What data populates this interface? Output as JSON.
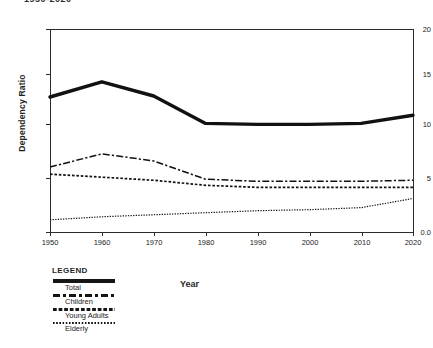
{
  "title_clipped": "1950-2020",
  "chart_data": {
    "type": "line",
    "title": "1950-2020",
    "xlabel": "Year",
    "ylabel": "Dependency Ratio",
    "x": [
      1950,
      1960,
      1970,
      1980,
      1990,
      2000,
      2010,
      2020
    ],
    "xticklabels": [
      "1950",
      "1960",
      "1970",
      "1980",
      "1990",
      "2000",
      "2010",
      "2020"
    ],
    "yticklabels": [
      "0.0",
      "5",
      "10",
      "15",
      "20"
    ],
    "ytickvalues": [
      0,
      5,
      10,
      15,
      20
    ],
    "xlim": [
      1950,
      2020
    ],
    "ylim": [
      0,
      20
    ],
    "grid": false,
    "legend_position": "below-left",
    "series": [
      {
        "name": "Total",
        "style": "solid-thick",
        "values": [
          13.3,
          14.8,
          13.4,
          10.7,
          10.6,
          10.6,
          10.7,
          11.5
        ]
      },
      {
        "name": "Children",
        "style": "dash-dot",
        "values": [
          6.4,
          7.7,
          7.0,
          5.2,
          5.0,
          5.0,
          5.0,
          5.1
        ]
      },
      {
        "name": "Young Adults",
        "style": "dashed",
        "values": [
          5.7,
          5.4,
          5.1,
          4.6,
          4.4,
          4.4,
          4.4,
          4.4
        ]
      },
      {
        "name": "Elderly",
        "style": "dotted",
        "values": [
          1.2,
          1.5,
          1.7,
          1.9,
          2.1,
          2.2,
          2.4,
          3.3
        ]
      }
    ]
  },
  "legend": {
    "title": "LEGEND",
    "entries": [
      {
        "label": "Total"
      },
      {
        "label": "Children"
      },
      {
        "label": "Young Adults"
      },
      {
        "label": "Elderly"
      }
    ]
  },
  "axes": {
    "y": {
      "label": "Dependency Ratio",
      "ticks": [
        {
          "label": "20"
        },
        {
          "label": "15"
        },
        {
          "label": "10"
        },
        {
          "label": "5"
        },
        {
          "label": "0.0"
        }
      ]
    },
    "x": {
      "label": "Year",
      "ticks": [
        {
          "label": "1950"
        },
        {
          "label": "1960"
        },
        {
          "label": "1970"
        },
        {
          "label": "1980"
        },
        {
          "label": "1990"
        },
        {
          "label": "2000"
        },
        {
          "label": "2010"
        },
        {
          "label": "2020"
        }
      ]
    }
  }
}
